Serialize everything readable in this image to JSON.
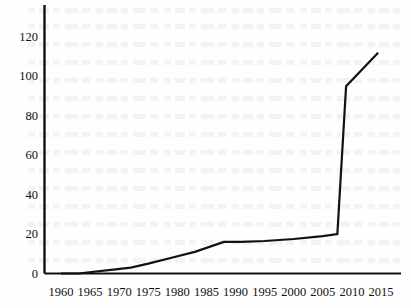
{
  "chart_data": {
    "type": "line",
    "title": "",
    "subtitle": "",
    "xlabel": "",
    "ylabel": "",
    "xlim": [
      1958.5,
      2016.5
    ],
    "ylim": [
      0,
      128
    ],
    "grid": false,
    "legend": null,
    "legend_position": "none",
    "axis_style": "left-and-bottom-spine-only",
    "line_color": "#111111",
    "line_width_px": 2.2,
    "markers": false,
    "ytick_labels": [
      "0",
      "20",
      "40",
      "60",
      "80",
      "100",
      "120"
    ],
    "ytick_values": [
      0,
      20,
      40,
      60,
      80,
      100,
      120
    ],
    "xtick_labels": [
      "1960",
      "1965",
      "1970",
      "1975",
      "1980",
      "1985",
      "1990",
      "1995",
      "2000",
      "2005",
      "2010",
      "2015"
    ],
    "xtick_values": [
      1960,
      1965,
      1970,
      1975,
      1980,
      1985,
      1990,
      1995,
      2000,
      2005,
      2010,
      2015
    ],
    "series": [
      {
        "name": "series-1",
        "x": [
          1960,
          1963,
          1966,
          1969,
          1972,
          1975,
          1979,
          1983,
          1988,
          1991,
          1995,
          2000,
          2005,
          2007.5,
          2009,
          2014.5
        ],
        "values": [
          0,
          0,
          1,
          2,
          3,
          5,
          8,
          11,
          16,
          16,
          16.5,
          17.5,
          19,
          20,
          95,
          112
        ]
      }
    ],
    "annotations": []
  },
  "axes": {
    "y_axis_name": "value-axis",
    "x_axis_name": "year-axis"
  }
}
